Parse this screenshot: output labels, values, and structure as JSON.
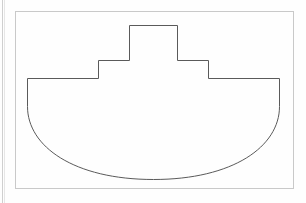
{
  "document": {
    "kind": "scanned-line-drawing",
    "background_color": "#fefefe",
    "page_edge_color": "#d4d4d4",
    "stroke_color": "#5a5a5a",
    "frame_stroke_color": "#c9c9c9",
    "caption_text": "Line drawing of a boat-shaped figure inside a rectangular frame"
  },
  "frame": {
    "label": "figure-border-rectangle",
    "x": 15,
    "y": 11,
    "width": 278,
    "height": 177,
    "stroke_width": 1
  },
  "figure": {
    "name": "boat-outline",
    "stroke_width": 1,
    "fill": "none",
    "path": "M 27.5 78.5 L 98.5 78.5 L 98.5 60.5 L 129.5 60.5 L 129.5 25.5 L 177.5 25.5 L 177.5 60.5 L 208.5 60.5 L 208.5 78.5 L 279.5 78.5 L 279.5 106.5 C 279.5 146.5 233.0 179.5 153.5 179.5 C 74.0 179.5 27.5 146.5 27.5 106.5 Z",
    "vertices": [
      {
        "name": "deck-left-end",
        "x": 27.5,
        "y": 78.5
      },
      {
        "name": "lower-step-left-outer",
        "x": 98.5,
        "y": 78.5
      },
      {
        "name": "lower-step-left-top",
        "x": 98.5,
        "y": 60.5
      },
      {
        "name": "upper-step-left-base",
        "x": 129.5,
        "y": 60.5
      },
      {
        "name": "upper-step-left-top",
        "x": 129.5,
        "y": 25.5
      },
      {
        "name": "upper-step-right-top",
        "x": 177.5,
        "y": 25.5
      },
      {
        "name": "upper-step-right-base",
        "x": 177.5,
        "y": 60.5
      },
      {
        "name": "lower-step-right-top",
        "x": 208.5,
        "y": 60.5
      },
      {
        "name": "lower-step-right-outer",
        "x": 208.5,
        "y": 78.5
      },
      {
        "name": "deck-right-end",
        "x": 279.5,
        "y": 78.5
      },
      {
        "name": "hull-right-shoulder",
        "x": 279.5,
        "y": 106.5
      },
      {
        "name": "hull-bottom",
        "x": 153.5,
        "y": 179.5
      },
      {
        "name": "hull-left-shoulder",
        "x": 27.5,
        "y": 106.5
      }
    ]
  }
}
